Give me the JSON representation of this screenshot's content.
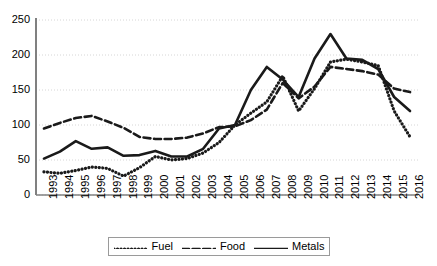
{
  "chart_data": {
    "type": "line",
    "title": "",
    "xlabel": "",
    "ylabel": "",
    "ylim": [
      0,
      250
    ],
    "ytick_step": 50,
    "yticks": [
      0,
      50,
      100,
      150,
      200,
      250
    ],
    "grid": true,
    "legend_position": "bottom",
    "categories": [
      "1993",
      "1994",
      "1995",
      "1996",
      "1997",
      "1998",
      "1999",
      "2000",
      "2001",
      "2002",
      "2003",
      "2004",
      "2005",
      "2006",
      "2007",
      "2008",
      "2009",
      "2010",
      "2011",
      "2012",
      "2013",
      "2014",
      "2015",
      "2016"
    ],
    "series": [
      {
        "name": "Fuel",
        "style": "dotted",
        "color": "#1a1a1a",
        "values": [
          33,
          31,
          35,
          40,
          38,
          27,
          39,
          55,
          50,
          52,
          60,
          75,
          100,
          117,
          133,
          170,
          120,
          152,
          190,
          194,
          190,
          185,
          120,
          83
        ]
      },
      {
        "name": "Food",
        "style": "dashed",
        "color": "#1a1a1a",
        "values": [
          95,
          103,
          110,
          113,
          105,
          96,
          83,
          80,
          80,
          82,
          88,
          97,
          98,
          107,
          122,
          160,
          138,
          155,
          183,
          180,
          177,
          172,
          152,
          147
        ]
      },
      {
        "name": "Metals",
        "style": "solid",
        "color": "#1a1a1a",
        "values": [
          52,
          62,
          77,
          66,
          68,
          56,
          57,
          63,
          55,
          55,
          66,
          95,
          100,
          150,
          183,
          165,
          140,
          195,
          230,
          195,
          193,
          180,
          140,
          120
        ]
      }
    ]
  },
  "legend": {
    "items": [
      {
        "label": "Fuel",
        "style": "dotted"
      },
      {
        "label": "Food",
        "style": "dashed"
      },
      {
        "label": "Metals",
        "style": "solid"
      }
    ]
  }
}
